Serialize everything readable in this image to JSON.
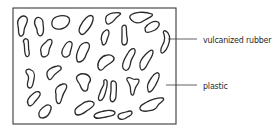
{
  "diagram": {
    "title": "",
    "labels": {
      "rubber": "vulcanized rubber",
      "plastic": "plastic"
    },
    "colors": {
      "stroke": "#2a2a2a",
      "background": "#ffffff"
    }
  }
}
